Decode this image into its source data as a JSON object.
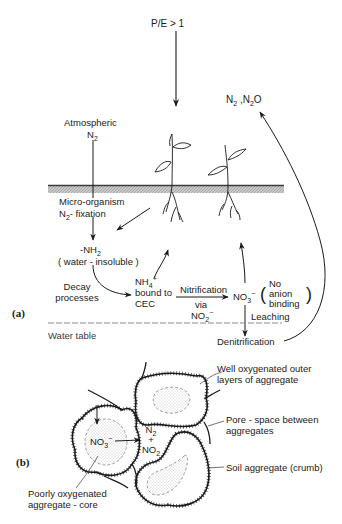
{
  "panel_a": {
    "label": "(a)",
    "precip_ratio": "P/E > 1",
    "gaseous_products": {
      "n2": "N",
      "n2_sub": "2",
      "sep": " ,",
      "n2o_n": "N",
      "n2o_sub": "2",
      "n2o_o": "O"
    },
    "atmospheric": "Atmospheric",
    "atm_n2": {
      "n": "N",
      "sub": "2"
    },
    "micro_organism": "Micro-organism",
    "fixation": {
      "n": "N",
      "sub": "2",
      "rest": "- fixation"
    },
    "organic_n": {
      "prefix": "-NH",
      "sub": "2"
    },
    "water_insoluble": "( water - insoluble )",
    "decay_line1": "Decay",
    "decay_line2": "processes",
    "ammonium": {
      "nh": "NH",
      "sub": "4",
      "sup": "+"
    },
    "bound_to": "bound to",
    "cec": "CEC",
    "nitrification": "Nitrification",
    "via": "via",
    "nitrite": {
      "no": "NO",
      "sub": "2",
      "sup": "−"
    },
    "nitrate": {
      "no": "NO",
      "sub": "3",
      "sup": "−"
    },
    "no_anion_line1": "No",
    "no_anion_line2": "anion",
    "no_anion_line3": "binding",
    "leaching": "Leaching",
    "denitrification": "Denitrification",
    "water_table": "Water table"
  },
  "panel_b": {
    "label": "(b)",
    "core_nitrate": {
      "no": "NO",
      "sub": "3",
      "sup": "−"
    },
    "products_n2": {
      "n": "N",
      "sub": "2"
    },
    "plus": "+",
    "products_no2": {
      "no": "NO",
      "sub": "2"
    },
    "callout_outer_line1": "Well oxygenated outer",
    "callout_outer_line2": "layers of aggregate",
    "callout_pore_line1": "Pore - space between",
    "callout_pore_line2": "aggregates",
    "callout_soil": "Soil aggregate (crumb)",
    "callout_core_line1": "Poorly oxygenated",
    "callout_core_line2": "aggregate - core"
  },
  "colors": {
    "ink": "#1a1a1a",
    "soil_band": "#b5b5b5",
    "stipple": "#9a9a9a"
  }
}
